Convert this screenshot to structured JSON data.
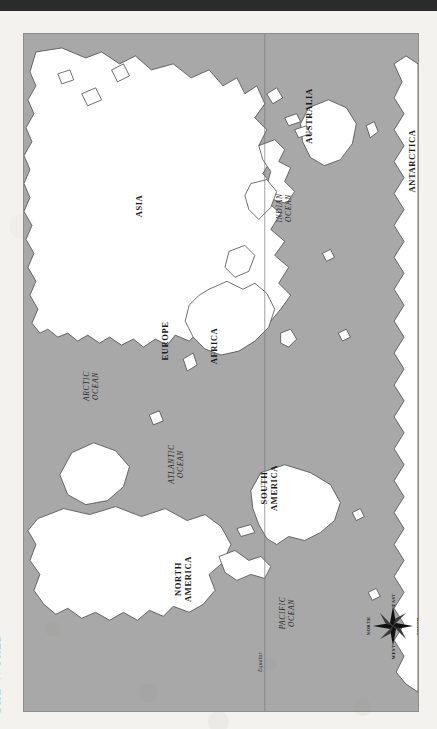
{
  "document": {
    "title": "The World",
    "orientation": "rotated-90-ccw",
    "map_type": "world-political-outline"
  },
  "colors": {
    "ocean": "#a8a8a8",
    "land": "#ffffff",
    "coastline": "#4a4a4a",
    "label_text": "#1a1a1a",
    "paper": "#f4f2ee",
    "scan_band": "#2b2b2b",
    "plate_border": "#8d8d8d"
  },
  "continents": [
    {
      "name": "ASIA",
      "line1": "ASIA",
      "line2": "",
      "x": 138,
      "y": 205
    },
    {
      "name": "EUROPE",
      "line1": "EUROPE",
      "line2": "",
      "x": 164,
      "y": 340
    },
    {
      "name": "AFRICA",
      "line1": "AFRICA",
      "line2": "",
      "x": 213,
      "y": 345
    },
    {
      "name": "AUSTRALIA",
      "line1": "AUSTRALIA",
      "line2": "",
      "x": 308,
      "y": 115
    },
    {
      "name": "ANTARCTICA",
      "line1": "ANTARCTICA",
      "line2": "",
      "x": 418,
      "y": 160
    },
    {
      "name": "NORTH AMERICA",
      "line1": "NORTH",
      "line2": "AMERICA",
      "x": 182,
      "y": 578
    },
    {
      "name": "SOUTH AMERICA",
      "line1": "SOUTH",
      "line2": "AMERICA",
      "x": 268,
      "y": 487
    }
  ],
  "oceans": [
    {
      "name": "ARCTIC OCEAN",
      "line1": "ARCTIC",
      "line2": "OCEAN",
      "x": 90,
      "y": 385
    },
    {
      "name": "ATLANTIC OCEAN",
      "line1": "ATLANTIC",
      "line2": "OCEAN",
      "x": 175,
      "y": 463
    },
    {
      "name": "INDIAN OCEAN",
      "line1": "INDIAN",
      "line2": "OCEAN",
      "x": 283,
      "y": 207
    },
    {
      "name": "PACIFIC OCEAN",
      "line1": "PACIFIC",
      "line2": "OCEAN",
      "x": 286,
      "y": 612
    }
  ],
  "equator": {
    "label": "Equator",
    "line_x": 265,
    "label_x": 259,
    "label_y": 661
  },
  "compass": {
    "name": "compass-rose",
    "points": 8,
    "north": "NORTH",
    "south": "SOUTH",
    "east": "EAST",
    "west": "WEST"
  }
}
